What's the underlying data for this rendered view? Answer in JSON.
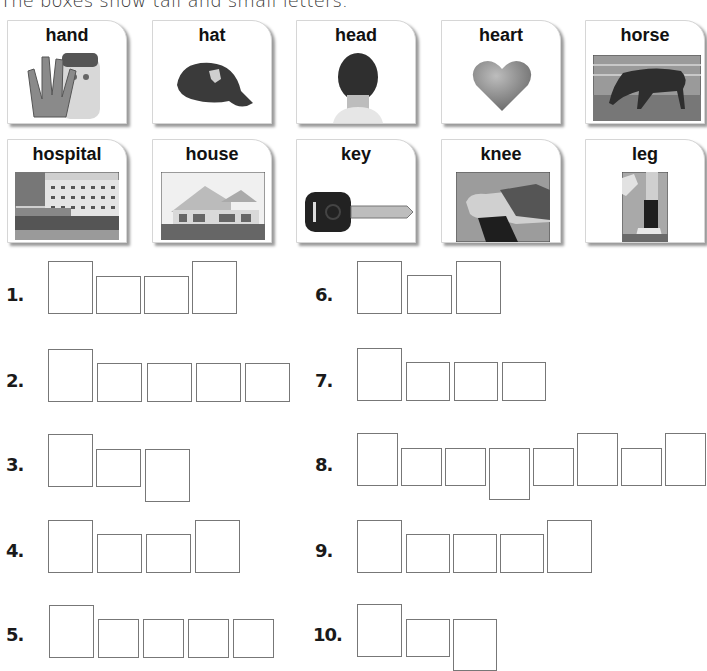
{
  "instruction": "The boxes show tall and small letters.",
  "cards": [
    {
      "word": "hand",
      "icon": "hand-photo-icon"
    },
    {
      "word": "hat",
      "icon": "cap-photo-icon"
    },
    {
      "word": "head",
      "icon": "head-photo-icon"
    },
    {
      "word": "heart",
      "icon": "heart-icon"
    },
    {
      "word": "horse",
      "icon": "horse-photo-icon"
    },
    {
      "word": "hospital",
      "icon": "hospital-photo-icon"
    },
    {
      "word": "house",
      "icon": "house-photo-icon"
    },
    {
      "word": "key",
      "icon": "key-photo-icon"
    },
    {
      "word": "knee",
      "icon": "knee-photo-icon"
    },
    {
      "word": "leg",
      "icon": "leg-photo-icon"
    }
  ],
  "exercises": [
    {
      "number": "1.",
      "pattern": [
        "tall",
        "small",
        "small",
        "tall"
      ]
    },
    {
      "number": "2.",
      "pattern": [
        "tall",
        "small",
        "small",
        "small",
        "small"
      ]
    },
    {
      "number": "3.",
      "pattern": [
        "tall",
        "small",
        "descender"
      ]
    },
    {
      "number": "4.",
      "pattern": [
        "tall",
        "small",
        "small",
        "tall"
      ]
    },
    {
      "number": "5.",
      "pattern": [
        "tall",
        "small",
        "small",
        "small",
        "small"
      ]
    },
    {
      "number": "6.",
      "pattern": [
        "tall",
        "small",
        "tall"
      ]
    },
    {
      "number": "7.",
      "pattern": [
        "tall",
        "small",
        "small",
        "small"
      ]
    },
    {
      "number": "8.",
      "pattern": [
        "tall",
        "small",
        "small",
        "descender",
        "small",
        "tall",
        "small",
        "tall"
      ]
    },
    {
      "number": "9.",
      "pattern": [
        "tall",
        "small",
        "small",
        "small",
        "tall"
      ]
    },
    {
      "number": "10.",
      "pattern": [
        "tall",
        "small",
        "descender"
      ]
    }
  ]
}
